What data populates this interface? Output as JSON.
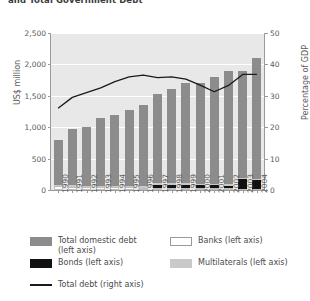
{
  "chart_data": {
    "type": "bar",
    "title": "and Total Government Debt",
    "subtitle": "",
    "xlabel": "",
    "ylabel": "US$ million",
    "y2label": "Percentage of GDP",
    "categories": [
      "1990",
      "1991",
      "1992",
      "1993",
      "1994",
      "1995",
      "1996",
      "1997",
      "1998",
      "1999",
      "2000",
      "2001",
      "2002",
      "2003",
      "2004"
    ],
    "ylim": [
      0,
      2500
    ],
    "yticks": [
      0,
      500,
      1000,
      1500,
      2000,
      2500
    ],
    "ytick_labels": [
      "0",
      "500",
      "1,000",
      "1,500",
      "2,000",
      "2,500"
    ],
    "y2lim": [
      0,
      50
    ],
    "y2ticks": [
      0,
      10,
      20,
      30,
      40,
      50
    ],
    "y2tick_labels": [
      "0",
      "10",
      "20",
      "30",
      "40",
      "50"
    ],
    "grid": true,
    "legend_position": "bottom",
    "stacked": true,
    "stack_order_bottom_up": [
      "Banks (left axis)",
      "Bonds (left axis)",
      "Multilaterals (left axis)",
      "Total domestic debt (left axis)"
    ],
    "series": [
      {
        "name": "Banks (left axis)",
        "axis": "left",
        "kind": "bar",
        "color": "#ffffff",
        "values": [
          60,
          55,
          50,
          48,
          45,
          42,
          40,
          38,
          35,
          33,
          30,
          28,
          26,
          24,
          22
        ]
      },
      {
        "name": "Bonds (left axis)",
        "axis": "left",
        "kind": "bar",
        "color": "#111111",
        "values": [
          0,
          0,
          0,
          0,
          0,
          0,
          0,
          45,
          48,
          50,
          48,
          50,
          45,
          150,
          130
        ]
      },
      {
        "name": "Multilaterals (left axis)",
        "axis": "left",
        "kind": "bar",
        "color": "#c9c9c9",
        "values": [
          20,
          20,
          20,
          20,
          20,
          20,
          20,
          22,
          22,
          22,
          22,
          22,
          22,
          25,
          25
        ]
      },
      {
        "name": "Total domestic debt (left axis)",
        "axis": "left",
        "kind": "bar",
        "color": "#8c8c8c",
        "values": [
          720,
          900,
          930,
          1085,
          1135,
          1210,
          1300,
          1420,
          1500,
          1600,
          1600,
          1700,
          1800,
          1700,
          1925
        ]
      },
      {
        "name": "Total debt (right axis)",
        "axis": "right",
        "kind": "line",
        "color": "#1a1a1a",
        "values": [
          26.0,
          29.5,
          31.0,
          32.5,
          34.5,
          36.0,
          36.6,
          35.8,
          36.0,
          35.3,
          33.4,
          31.3,
          33.3,
          36.8,
          36.8
        ]
      }
    ],
    "legend": [
      {
        "label": "Total domestic debt\n(left axis)",
        "swatch": "sw-domestic"
      },
      {
        "label": "Banks (left axis)",
        "swatch": "sw-banks"
      },
      {
        "label": "Bonds (left axis)",
        "swatch": "sw-bonds"
      },
      {
        "label": "Multilaterals (left axis)",
        "swatch": "sw-multi"
      },
      {
        "label": "Total debt (right axis)",
        "swatch": "sw-line"
      }
    ],
    "colors": {
      "plot_background": "#e8e8e8",
      "gridline": "#ffffff",
      "axis": "#9a9a9a",
      "text": "#5a5a5a",
      "domestic": "#8c8c8c",
      "multilaterals": "#c9c9c9",
      "bonds": "#111111",
      "banks": "#ffffff",
      "line": "#1a1a1a"
    }
  }
}
